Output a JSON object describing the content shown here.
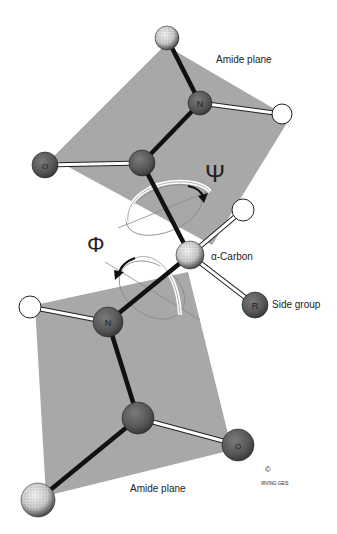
{
  "diagram": {
    "labels": {
      "amide_plane_top": "Amide plane",
      "amide_plane_bottom": "Amide plane",
      "alpha_carbon": "α-Carbon",
      "side_group": "Side group",
      "psi_symbol": "Ψ",
      "phi_symbol": "Φ",
      "copyright": "©",
      "signature": "IRVING GEIS"
    },
    "atoms": {
      "n_top": "N",
      "o_top": "O",
      "n_bottom": "N",
      "o_bottom": "O",
      "r_group": "R"
    },
    "colors": {
      "plane": "#a8a8a8",
      "atom_dark": "#5a5a5a",
      "atom_white": "#ffffff",
      "bond_black": "#111111",
      "background": "#ffffff"
    }
  }
}
